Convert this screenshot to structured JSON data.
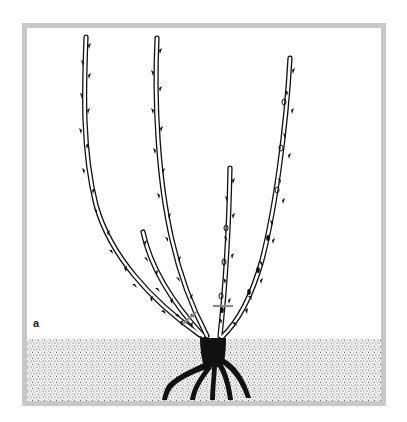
{
  "figure": {
    "label": "a",
    "colors": {
      "frame": "#c8c8c8",
      "ink": "#111111",
      "cut_mark": "#8a8a8a",
      "soil_dots": "#333333",
      "background": "#ffffff"
    },
    "canes": [
      {
        "name": "cane-far-left",
        "tip": [
          86,
          37
        ]
      },
      {
        "name": "cane-left-tall",
        "tip": [
          157,
          38
        ]
      },
      {
        "name": "cane-short-left",
        "tip": [
          143,
          232
        ]
      },
      {
        "name": "cane-center-right",
        "tip": [
          230,
          168
        ]
      },
      {
        "name": "cane-far-right",
        "tip": [
          290,
          58
        ]
      }
    ],
    "cut_marks": 2
  }
}
